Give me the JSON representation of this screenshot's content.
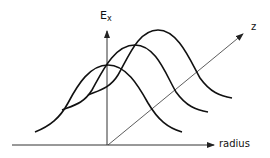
{
  "diagram": {
    "title": "",
    "axes": {
      "vertical": {
        "label_main": "E",
        "label_sub": "x"
      },
      "horizontal": {
        "label": "radius"
      },
      "depth": {
        "label": "z"
      }
    },
    "curves": [
      {
        "name": "profile-1",
        "position": "front"
      },
      {
        "name": "profile-2",
        "position": "middle"
      },
      {
        "name": "profile-3",
        "position": "back"
      }
    ],
    "colors": {
      "line": "#111111",
      "axis": "#333333",
      "background": "#ffffff"
    }
  }
}
